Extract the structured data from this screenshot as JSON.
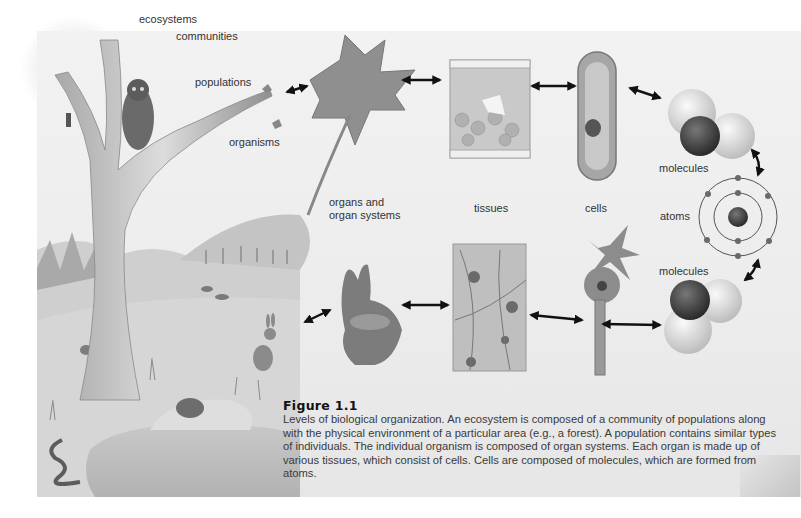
{
  "figure": {
    "number": "Figure 1.1",
    "caption": "Levels of biological organization. An ecosystem is composed of a community of populations along with the physical environment of a particular area (e.g., a forest). A population contains similar types of individuals. The individual organism is composed of organ systems. Each organ is made up of various tissues, which consist of cells. Cells are composed of molecules, which are formed from atoms."
  },
  "labels": {
    "ecosystems": "ecosystems",
    "communities": "communities",
    "populations": "populations",
    "organisms": "organisms",
    "organs_line1": "organs and",
    "organs_line2": "organ systems",
    "tissues": "tissues",
    "cells": "cells",
    "molecules_top": "molecules",
    "atoms": "atoms",
    "molecules_bottom": "molecules"
  },
  "illustrations": {
    "top_row": [
      "maple-leaf",
      "plant-tissue",
      "plant-cell",
      "water-molecule"
    ],
    "center": "atom-model",
    "bottom_row": [
      "rabbit-head",
      "nerve-tissue",
      "neuron",
      "water-molecule"
    ],
    "scene": [
      "tree",
      "owl",
      "woodpecker",
      "forest",
      "deer",
      "rabbit",
      "chipmunk",
      "turtle",
      "snake",
      "pond"
    ]
  },
  "colors": {
    "background": "#ffffff",
    "panel": "#ececec",
    "label_text": "#333333",
    "arrow": "#111111"
  }
}
